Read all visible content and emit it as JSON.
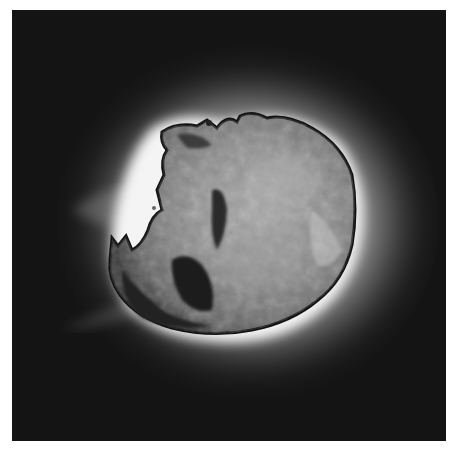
{
  "image": {
    "subject": "comet nucleus",
    "description": "Grayscale photograph of an irregular, rocky comet nucleus with a bright glowing halo and faint jets on a dark background",
    "colors": {
      "background": "#141414",
      "halo": "#e8e8e8",
      "surface_mid": "#8a8a8a",
      "surface_dark": "#1c1c1c",
      "border": "#ffffff"
    }
  }
}
